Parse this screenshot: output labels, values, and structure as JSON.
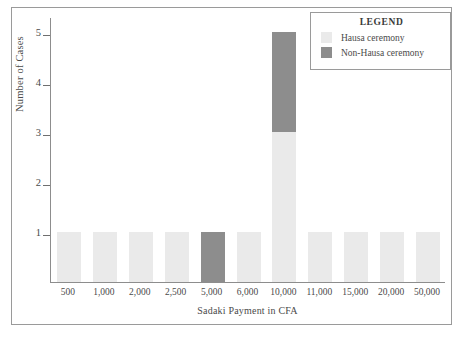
{
  "chart_data": {
    "type": "bar",
    "title": "",
    "xlabel": "Sadaki Payment in CFA",
    "ylabel": "Number of Cases",
    "categories": [
      "500",
      "1,000",
      "2,000",
      "2,500",
      "5,000",
      "6,000",
      "10,000",
      "11,000",
      "15,000",
      "20,000",
      "50,000"
    ],
    "series": [
      {
        "name": "Hausa ceremony",
        "color": "#eaeaea",
        "values": [
          1,
          1,
          1,
          1,
          0,
          1,
          3,
          1,
          1,
          1,
          1
        ]
      },
      {
        "name": "Non-Hausa ceremony",
        "color": "#8d8d8d",
        "values": [
          0,
          0,
          0,
          0,
          1,
          0,
          2,
          0,
          0,
          0,
          0
        ]
      }
    ],
    "stacked": true,
    "ylim": [
      0,
      5.3
    ],
    "yticks": [
      1,
      2,
      3,
      4,
      5
    ],
    "ytick_labels": [
      "1",
      "2",
      "3",
      "4",
      "5"
    ],
    "grid": false,
    "legend_position": "top-right"
  },
  "legend": {
    "title": "LEGEND",
    "entries": [
      {
        "label": "Hausa ceremony",
        "color": "#eaeaea"
      },
      {
        "label": "Non-Hausa ceremony",
        "color": "#8d8d8d"
      }
    ]
  },
  "axes": {
    "y_title": "Number of Cases",
    "x_title": "Sadaki Payment in CFA"
  }
}
